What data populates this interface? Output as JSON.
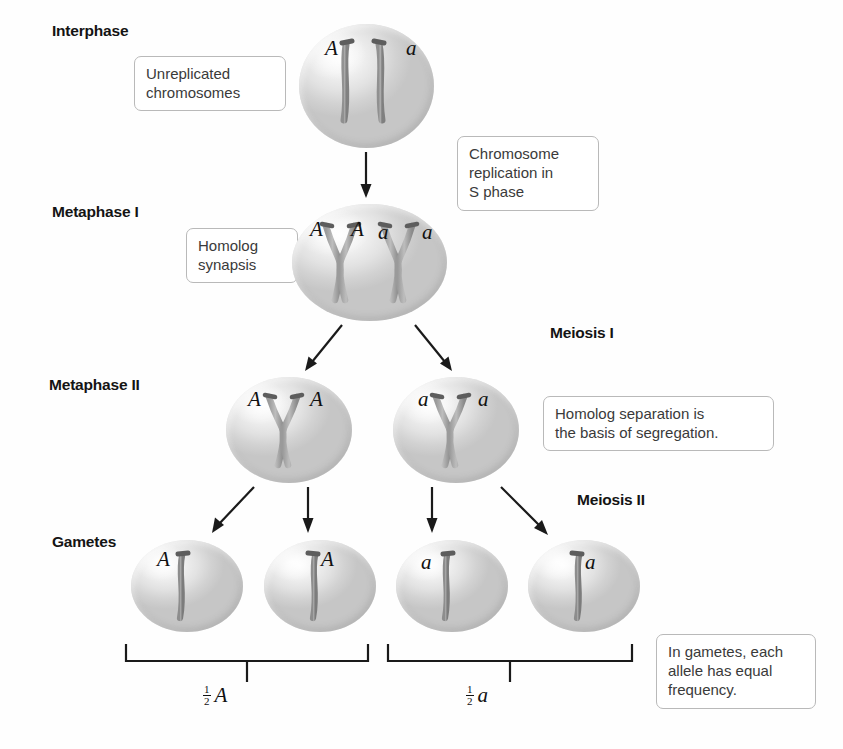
{
  "figure": {
    "background_color": "#fefefe",
    "line_color": "#1a1a1a",
    "box_border_color": "#b9b9b9",
    "cell_fill_color": "#e2e2e2",
    "chromosome_color": "#9a9a9a"
  },
  "stage_labels": [
    {
      "id": "interphase",
      "text": "Interphase"
    },
    {
      "id": "metaphase-i",
      "text": "Metaphase I"
    },
    {
      "id": "metaphase-ii",
      "text": "Metaphase II"
    },
    {
      "id": "gametes",
      "text": "Gametes"
    }
  ],
  "meiosis_labels": [
    {
      "id": "meiosis-i",
      "text": "Meiosis I"
    },
    {
      "id": "meiosis-ii",
      "text": "Meiosis II"
    }
  ],
  "callouts": [
    {
      "id": "unreplicated-chromosomes",
      "text": "Unreplicated\nchromosomes"
    },
    {
      "id": "chromosome-replication",
      "text": "Chromosome\nreplication in\nS phase"
    },
    {
      "id": "homolog-synapsis",
      "text": "Homolog\nsynapsis"
    },
    {
      "id": "homolog-separation",
      "text": "Homolog separation is\nthe basis of segregation."
    },
    {
      "id": "equal-frequency",
      "text": "In gametes, each\nallele has equal\nfrequency."
    }
  ],
  "cells": {
    "interphase": {
      "id": "interphase-cell",
      "chromosome_count": 2,
      "chromosome_type": "unreplicated",
      "alleles": [
        "A",
        "a"
      ]
    },
    "metaphase_i": {
      "id": "metaphase-i-cell",
      "chromosome_count": 2,
      "chromosome_type": "replicated",
      "alleles": [
        "A",
        "A",
        "a",
        "a"
      ]
    },
    "metaphase_ii": [
      {
        "id": "metaphase-ii-cell-left",
        "chromosome_count": 1,
        "chromosome_type": "replicated",
        "alleles": [
          "A",
          "A"
        ]
      },
      {
        "id": "metaphase-ii-cell-right",
        "chromosome_count": 1,
        "chromosome_type": "replicated",
        "alleles": [
          "a",
          "a"
        ]
      }
    ],
    "gametes": [
      {
        "id": "gamete-1",
        "allele": "A",
        "allele_side": "left"
      },
      {
        "id": "gamete-2",
        "allele": "A",
        "allele_side": "right"
      },
      {
        "id": "gamete-3",
        "allele": "a",
        "allele_side": "left"
      },
      {
        "id": "gamete-4",
        "allele": "a",
        "allele_side": "right"
      }
    ]
  },
  "brackets": [
    {
      "id": "bracket-a",
      "numerator": "1",
      "denominator": "2",
      "allele": "A"
    },
    {
      "id": "bracket-a-lower",
      "numerator": "1",
      "denominator": "2",
      "allele": "a"
    }
  ],
  "arrows": [
    {
      "id": "arrow-interphase-to-metaphase-i",
      "direction": "down"
    },
    {
      "id": "arrow-meiosis-i-left",
      "direction": "down-left"
    },
    {
      "id": "arrow-meiosis-i-right",
      "direction": "down-right"
    },
    {
      "id": "arrow-meiosis-ii-1",
      "direction": "down-left"
    },
    {
      "id": "arrow-meiosis-ii-2",
      "direction": "down"
    },
    {
      "id": "arrow-meiosis-ii-3",
      "direction": "down"
    },
    {
      "id": "arrow-meiosis-ii-4",
      "direction": "down-right"
    }
  ]
}
